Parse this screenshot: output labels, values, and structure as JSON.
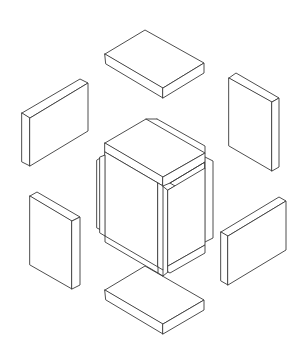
{
  "figure": {
    "title": "Isometric exploded view: central cross-shaped block assembly surrounded by six rectangular slabs",
    "background": "#ffffff",
    "stroke_color": "#3a3a3a",
    "parts": [
      {
        "id": "center-assembly",
        "label": "central interlocking block assembly"
      },
      {
        "id": "slab-top",
        "label": "top horizontal slab"
      },
      {
        "id": "slab-upper-left",
        "label": "upper-left vertical slab"
      },
      {
        "id": "slab-upper-right",
        "label": "upper-right vertical slab"
      },
      {
        "id": "slab-lower-left",
        "label": "lower-left vertical slab"
      },
      {
        "id": "slab-lower-right",
        "label": "lower-right vertical slab"
      },
      {
        "id": "slab-bottom",
        "label": "bottom horizontal slab"
      }
    ]
  }
}
